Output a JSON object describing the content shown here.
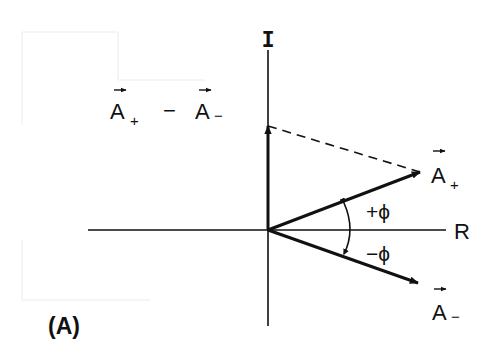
{
  "figure": {
    "panel_label": "(A)",
    "axes": {
      "imaginary_label": "I",
      "real_label": "R"
    },
    "vectors": {
      "a_plus": {
        "base": "A",
        "subscript": "+",
        "angle": "+φ"
      },
      "a_minus": {
        "base": "A",
        "subscript": "−",
        "angle": "−φ"
      },
      "difference": {
        "label_left": "A",
        "sub_left": "+",
        "operator": "−",
        "label_right": "A",
        "sub_right": "−"
      }
    },
    "angle_labels": {
      "plus_phi": "+ϕ",
      "minus_phi": "−ϕ"
    }
  },
  "colors": {
    "ink": "#111111",
    "background": "#ffffff",
    "bleed_through": "#e6e6e6"
  }
}
